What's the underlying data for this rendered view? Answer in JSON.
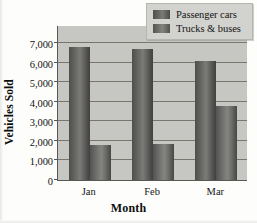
{
  "chart_data": {
    "type": "bar",
    "title": "",
    "xlabel": "Month",
    "ylabel": "Vehicles Sold",
    "categories": [
      "Jan",
      "Feb",
      "Mar"
    ],
    "series": [
      {
        "name": "Passenger cars",
        "values": [
          6800,
          6700,
          6100
        ]
      },
      {
        "name": "Trucks & buses",
        "values": [
          1800,
          1850,
          3800
        ]
      }
    ],
    "ylim": [
      0,
      7000
    ],
    "ytick_labels": [
      "7,000",
      "6,000",
      "5,000",
      "4,000",
      "3,000",
      "2,000",
      "1,000",
      "0"
    ],
    "ytick_values": [
      7000,
      6000,
      5000,
      4000,
      3000,
      2000,
      1000,
      0
    ],
    "grid": true,
    "legend_position": "top-right",
    "colors": {
      "passenger_cars": "#696965",
      "trucks_buses": "#767671",
      "plot_background": "#c6c6c2",
      "gridline": "#77776f",
      "axis": "#585856",
      "legend_background": "#d2d2ce",
      "text": "#131313"
    }
  },
  "axes": {
    "y_title": "Vehicles Sold",
    "x_title": "Month"
  },
  "legend": {
    "entries": [
      {
        "label": "Passenger cars",
        "swatch": "legend-swatch-cars"
      },
      {
        "label": "Trucks & buses",
        "swatch": "legend-swatch-trucks"
      }
    ]
  }
}
